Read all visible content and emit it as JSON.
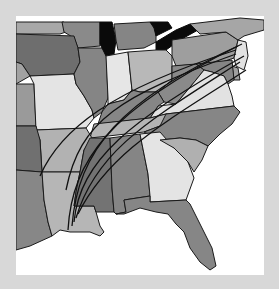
{
  "map": {
    "description": "Grayscale choropleth of the eastern United States with storm track arcs",
    "colors": {
      "frame": "#d8d8d8",
      "background": "#ffffff",
      "state_border": "#1a1a1a",
      "lakes": "#0a0a0a",
      "tracks": "#111111",
      "shade_dark": "#6e6e6e",
      "shade_mid_dark": "#858585",
      "shade_mid": "#9c9c9c",
      "shade_light": "#b5b5b5",
      "shade_lightest": "#e4e4e4"
    },
    "states": [
      {
        "name": "Minnesota",
        "shade": "shade_mid"
      },
      {
        "name": "Iowa",
        "shade": "shade_dark"
      },
      {
        "name": "Nebraska",
        "shade": "shade_mid"
      },
      {
        "name": "Kansas",
        "shade": "shade_mid"
      },
      {
        "name": "Missouri",
        "shade": "shade_lightest"
      },
      {
        "name": "Oklahoma",
        "shade": "shade_dark"
      },
      {
        "name": "Texas",
        "shade": "shade_mid_dark"
      },
      {
        "name": "Arkansas",
        "shade": "shade_light"
      },
      {
        "name": "Louisiana",
        "shade": "shade_light"
      },
      {
        "name": "Wisconsin",
        "shade": "shade_mid_dark"
      },
      {
        "name": "Illinois",
        "shade": "shade_mid_dark"
      },
      {
        "name": "Michigan",
        "shade": "shade_mid_dark"
      },
      {
        "name": "Indiana",
        "shade": "shade_lightest"
      },
      {
        "name": "Ohio",
        "shade": "shade_light"
      },
      {
        "name": "Kentucky",
        "shade": "shade_mid_dark"
      },
      {
        "name": "Tennessee",
        "shade": "shade_light"
      },
      {
        "name": "Mississippi",
        "shade": "shade_dark"
      },
      {
        "name": "Alabama",
        "shade": "shade_mid_dark"
      },
      {
        "name": "Georgia",
        "shade": "shade_lightest"
      },
      {
        "name": "Florida",
        "shade": "shade_mid_dark"
      },
      {
        "name": "South Carolina",
        "shade": "shade_light"
      },
      {
        "name": "North Carolina",
        "shade": "shade_mid_dark"
      },
      {
        "name": "Virginia",
        "shade": "shade_lightest"
      },
      {
        "name": "West Virginia",
        "shade": "shade_mid_dark"
      },
      {
        "name": "Pennsylvania",
        "shade": "shade_mid"
      },
      {
        "name": "New York",
        "shade": "shade_mid"
      },
      {
        "name": "Maryland",
        "shade": "shade_mid_dark"
      },
      {
        "name": "Delaware",
        "shade": "shade_mid"
      },
      {
        "name": "New Jersey",
        "shade": "shade_lightest"
      }
    ],
    "lakes": [
      "Lake Michigan",
      "Lake Erie",
      "Lake Huron"
    ],
    "tracks": {
      "count": 6,
      "origin_region": "Louisiana",
      "destination_region": "Mid-Atlantic / New Jersey"
    }
  }
}
